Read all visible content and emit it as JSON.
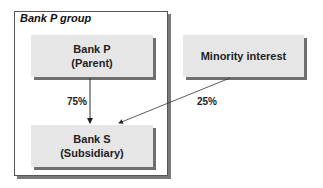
{
  "group": {
    "title": "Bank P group"
  },
  "nodes": {
    "parent": {
      "line1": "Bank P",
      "line2": "(Parent)"
    },
    "subsidiary": {
      "line1": "Bank S",
      "line2": "(Subsidiary)"
    },
    "minority": {
      "line1": "Minority interest"
    }
  },
  "edges": {
    "parent_to_subsidiary": {
      "label": "75%"
    },
    "minority_to_subsidiary": {
      "label": "25%"
    }
  },
  "colors": {
    "box_fill": "#e6e6e6",
    "shadow": "#6f6f6f",
    "line": "#333333"
  }
}
